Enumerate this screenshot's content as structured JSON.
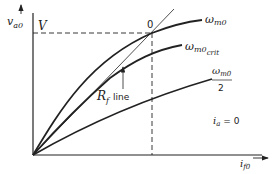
{
  "diagram": {
    "type": "magnetization-curves",
    "axes": {
      "y_label": "v",
      "y_label_sub": "a0",
      "x_label": "i",
      "x_label_sub": "f0"
    },
    "operating_point": {
      "label": "0",
      "voltage_label": "V"
    },
    "resistance_line": {
      "label_main": "R",
      "label_sub": "f",
      "label_suffix": "line"
    },
    "curves": [
      {
        "id": "wm0",
        "label": "ω",
        "sub": "m0",
        "extra": ""
      },
      {
        "id": "wm0crit",
        "label": "ω",
        "sub": "m0",
        "extra": "crit"
      },
      {
        "id": "wm0half",
        "label": "ω",
        "sub": "m0",
        "denominator": "2"
      }
    ],
    "condition": {
      "label_main": "i",
      "label_sub": "a",
      "label_rest": " = 0"
    },
    "colors": {
      "ink": "#222222",
      "background": "#ffffff"
    }
  }
}
